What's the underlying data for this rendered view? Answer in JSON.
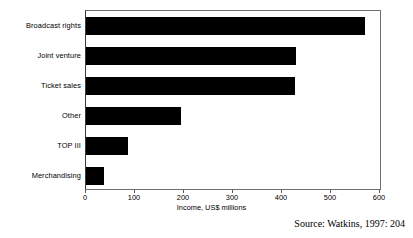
{
  "chart_data": {
    "type": "bar",
    "orientation": "horizontal",
    "title": "",
    "subtitle": "",
    "categories": [
      "Broadcast rights",
      "Joint venture",
      "Ticket sales",
      "Other",
      "TOP III",
      "Merchandising"
    ],
    "values": [
      570,
      428,
      426,
      194,
      86,
      37
    ],
    "xlabel": "Income, US$ millions",
    "ylabel": "",
    "xlim": [
      0,
      600
    ],
    "xticks": [
      0,
      100,
      200,
      300,
      400,
      500,
      600
    ],
    "xtick_labels": [
      "0",
      "100",
      "200",
      "300",
      "400",
      "500",
      "600"
    ],
    "grid": false,
    "legend": false,
    "bar_color": "#000000",
    "frame_color": "#6e6e6e",
    "annotations": [
      "Source:  Watkins, 1997: 204"
    ]
  },
  "source": {
    "text": "Source:  Watkins, 1997: 204"
  }
}
